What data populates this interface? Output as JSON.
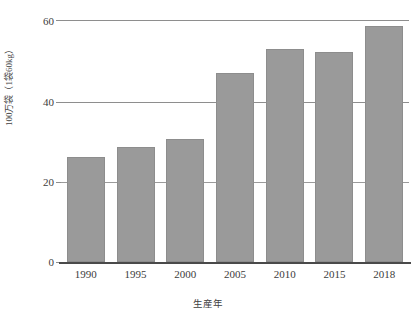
{
  "chart_data": {
    "type": "bar",
    "title": "",
    "xlabel": "生産年",
    "ylabel": "100万袋（1袋60kg）",
    "categories": [
      "1990",
      "1995",
      "2000",
      "2005",
      "2010",
      "2015",
      "2018"
    ],
    "values": [
      27,
      29.5,
      31.5,
      48.5,
      54.5,
      53.8,
      60.5
    ],
    "ylim": [
      0,
      62
    ],
    "yticks": [
      "0",
      "20",
      "40",
      "60"
    ],
    "ytick_values": [
      0,
      20,
      40,
      60
    ],
    "grid": true,
    "legend": "none",
    "bar_color": "#9a9a9a",
    "axis_color": "#4a4a4a",
    "gridline_color": "#8e8e8e"
  },
  "axes": {
    "y_title": "100万袋（1袋60kg）",
    "x_title": "生産年",
    "y_ticks": [
      {
        "label": "60"
      },
      {
        "label": "40"
      },
      {
        "label": "20"
      },
      {
        "label": "0"
      }
    ],
    "x_ticks": [
      {
        "label": "1990"
      },
      {
        "label": "1995"
      },
      {
        "label": "2000"
      },
      {
        "label": "2005"
      },
      {
        "label": "2010"
      },
      {
        "label": "2015"
      },
      {
        "label": "2018"
      }
    ]
  },
  "bars": [
    {
      "category": "1990",
      "value": 27
    },
    {
      "category": "1995",
      "value": 29.5
    },
    {
      "category": "2000",
      "value": 31.5
    },
    {
      "category": "2005",
      "value": 48.5
    },
    {
      "category": "2010",
      "value": 54.5
    },
    {
      "category": "2015",
      "value": 53.8
    },
    {
      "category": "2018",
      "value": 60.5
    }
  ]
}
